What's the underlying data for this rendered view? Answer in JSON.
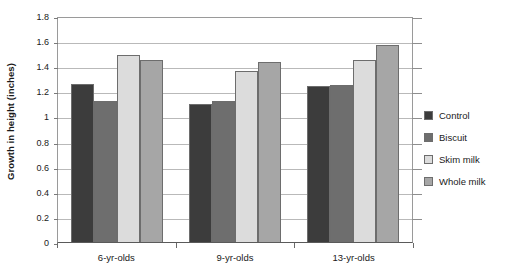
{
  "chart_data": {
    "type": "bar",
    "title": "",
    "subtitle": "",
    "xlabel": "",
    "ylabel": "Growth in height (inches)",
    "categories": [
      "6-yr-olds",
      "9-yr-olds",
      "13-yr-olds"
    ],
    "series": [
      {
        "name": "Control",
        "color": "#3c3c3c",
        "values": [
          1.26,
          1.1,
          1.24
        ]
      },
      {
        "name": "Biscuit",
        "color": "#6e6e6e",
        "values": [
          1.12,
          1.12,
          1.25
        ]
      },
      {
        "name": "Skim milk",
        "color": "#dcdcdc",
        "values": [
          1.49,
          1.36,
          1.45
        ]
      },
      {
        "name": "Whole milk",
        "color": "#a6a6a6",
        "values": [
          1.45,
          1.43,
          1.57
        ]
      }
    ],
    "ylim": [
      0,
      1.8
    ],
    "ytick_values": [
      0,
      0.2,
      0.4,
      0.6,
      0.8,
      1,
      1.2,
      1.4,
      1.6,
      1.8
    ],
    "ytick_labels": [
      "0",
      "0.2",
      "0.4",
      "0.6",
      "0.8",
      "1",
      "1.2",
      "1.4",
      "1.6",
      "1.8"
    ],
    "grid": true,
    "grid_orientation": "horizontal",
    "legend_position": "right",
    "legend_entries": [
      "Control",
      "Biscuit",
      "Skim milk",
      "Whole milk"
    ]
  }
}
